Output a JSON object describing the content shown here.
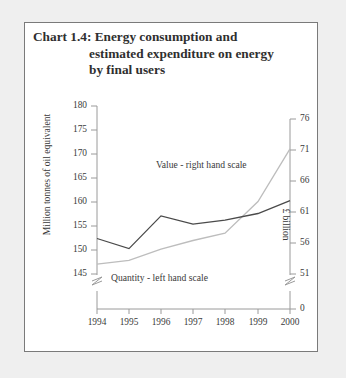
{
  "chart_data": {
    "type": "line",
    "title": "Chart 1.4: Energy consumption and estimated expenditure on energy by final users",
    "title_lines": [
      "Chart 1.4: Energy consumption and",
      "estimated expenditure on energy",
      "by final users"
    ],
    "xlabel": "",
    "categories": [
      "1994",
      "1995",
      "1996",
      "1997",
      "1998",
      "1999",
      "2000"
    ],
    "x": [
      1994,
      1995,
      1996,
      1997,
      1998,
      1999,
      2000
    ],
    "grid": false,
    "legend_position": "inline-annotations",
    "annotations": [
      "Value - right hand scale",
      "Quantity - left hand scale"
    ],
    "axes": [
      {
        "side": "left",
        "label": "Million tonnes of oil equivalent",
        "ylim": [
          145,
          180
        ],
        "ticks": [
          145,
          150,
          155,
          160,
          165,
          170,
          175,
          180
        ],
        "tick_labels": [
          "145",
          "150",
          "155",
          "160",
          "165",
          "170",
          "175",
          "180"
        ],
        "axis_break": true
      },
      {
        "side": "right",
        "label": "£ billion",
        "ylim": [
          51,
          76
        ],
        "ticks": [
          0,
          51,
          56,
          61,
          66,
          71,
          76
        ],
        "tick_labels": [
          "0",
          "51",
          "56",
          "61",
          "66",
          "71",
          "76"
        ],
        "axis_break": true
      }
    ],
    "series": [
      {
        "name": "Quantity - left hand scale",
        "axis": "left",
        "color": "#4a4a4a",
        "unit": "Million tonnes of oil equivalent",
        "values": [
          152.4,
          150.3,
          157.1,
          155.4,
          156.2,
          157.6,
          160.3
        ]
      },
      {
        "name": "Value - right hand scale",
        "axis": "right",
        "color": "#bdbdbd",
        "unit": "£ billion",
        "values": [
          52.6,
          53.2,
          55.0,
          56.4,
          57.6,
          62.7,
          71.2
        ]
      }
    ]
  }
}
